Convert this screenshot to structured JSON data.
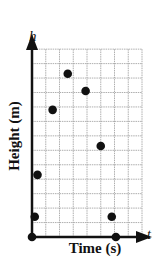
{
  "chart_data": {
    "type": "scatter",
    "title": "",
    "xlabel": "Time (s)",
    "ylabel": "Height (m)",
    "x_axis_symbol": "t",
    "y_axis_symbol": "h",
    "grid": true,
    "grid_columns": 8,
    "grid_rows": 13,
    "xlim": [
      0,
      8
    ],
    "ylim": [
      0,
      13
    ],
    "tick_labels": "none",
    "legend": "none",
    "points": [
      {
        "t": 0.0,
        "h": 0.0
      },
      {
        "t": 0.2,
        "h": 1.4
      },
      {
        "t": 0.4,
        "h": 4.3
      },
      {
        "t": 1.5,
        "h": 8.8
      },
      {
        "t": 2.6,
        "h": 11.3
      },
      {
        "t": 3.9,
        "h": 10.1
      },
      {
        "t": 5.0,
        "h": 6.3
      },
      {
        "t": 5.8,
        "h": 1.4
      },
      {
        "t": 6.1,
        "h": 0.0
      }
    ]
  },
  "labels": {
    "ylabel": "Height (m)",
    "xlabel": "Time (s)",
    "h_symbol": "h",
    "t_symbol": "t"
  },
  "colors": {
    "grid": "#9a9a9a",
    "axis": "#111111",
    "point": "#111111",
    "background": "#ffffff"
  }
}
